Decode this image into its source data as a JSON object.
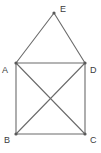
{
  "diagram": {
    "type": "graph",
    "title": "",
    "canvas": {
      "width": 101,
      "height": 153,
      "background": "#ffffff"
    },
    "style": {
      "edge_color": "#6b6b6b",
      "vertex_color": "#595959",
      "label_color": "#3c3c3c",
      "edge_width": 1.1,
      "vertex_radius": 1.6
    },
    "vertices": [
      {
        "id": "A",
        "label": "A",
        "x": 16,
        "y": 63,
        "label_x": 2,
        "label_y": 66
      },
      {
        "id": "B",
        "label": "B",
        "x": 16,
        "y": 134,
        "label_x": 4,
        "label_y": 136
      },
      {
        "id": "C",
        "label": "C",
        "x": 85,
        "y": 134,
        "label_x": 90,
        "label_y": 136
      },
      {
        "id": "D",
        "label": "D",
        "x": 85,
        "y": 63,
        "label_x": 90,
        "label_y": 66
      },
      {
        "id": "E",
        "label": "E",
        "x": 54,
        "y": 13,
        "label_x": 60,
        "label_y": 5
      }
    ],
    "edges": [
      {
        "from": "A",
        "to": "E"
      },
      {
        "from": "E",
        "to": "D"
      },
      {
        "from": "A",
        "to": "D"
      },
      {
        "from": "A",
        "to": "B"
      },
      {
        "from": "D",
        "to": "C"
      },
      {
        "from": "B",
        "to": "C"
      },
      {
        "from": "A",
        "to": "C"
      },
      {
        "from": "B",
        "to": "D"
      }
    ]
  }
}
